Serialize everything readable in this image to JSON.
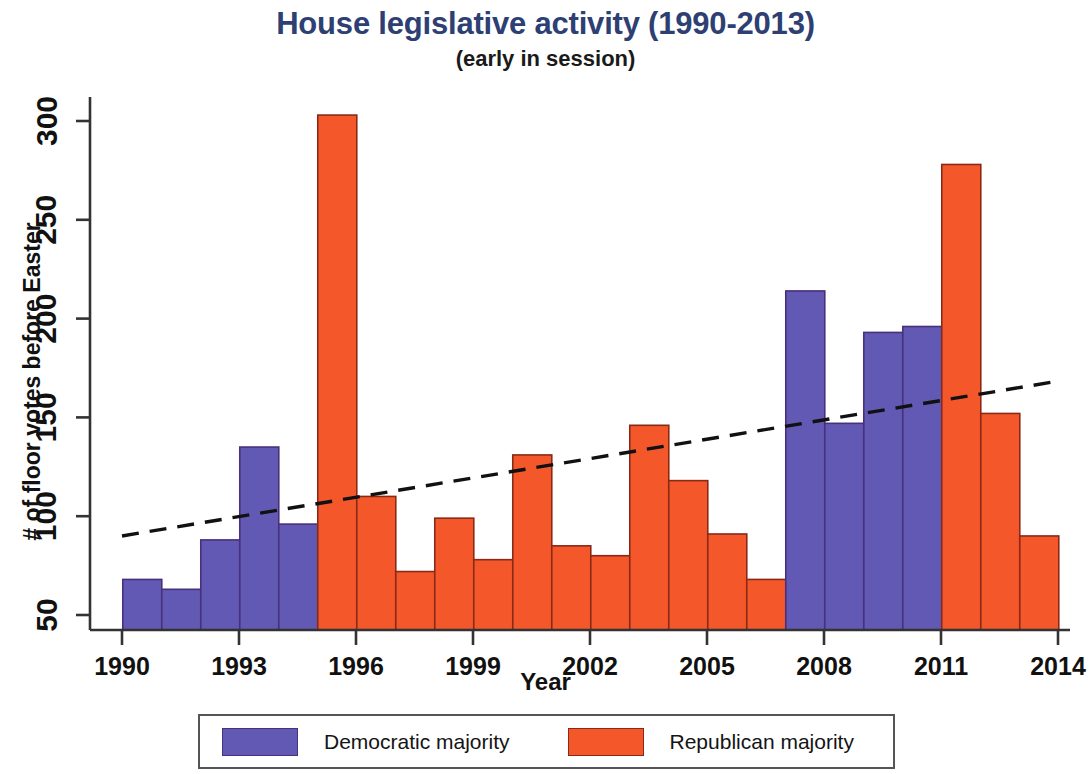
{
  "chart_data": {
    "type": "bar",
    "title": "House legislative activity (1990-2013)",
    "subtitle": "(early in session)",
    "xlabel": "Year",
    "ylabel": "# of floor votes before Easter",
    "xlim": [
      1989.4,
      2014.1
    ],
    "ylim": [
      50,
      310
    ],
    "grid": false,
    "xticks": [
      1990,
      1993,
      1996,
      1999,
      2002,
      2005,
      2008,
      2011,
      2014
    ],
    "xtick_labels": [
      "1990",
      "1993",
      "1996",
      "1999",
      "2002",
      "2005",
      "2008",
      "2011",
      "2014"
    ],
    "yticks": [
      50,
      100,
      150,
      200,
      250,
      300
    ],
    "ytick_labels": [
      "50",
      "100",
      "150",
      "200",
      "250",
      "300"
    ],
    "legend_position": "bottom",
    "categories": [
      1990,
      1991,
      1992,
      1993,
      1994,
      1995,
      1996,
      1997,
      1998,
      1999,
      2000,
      2001,
      2002,
      2003,
      2004,
      2005,
      2006,
      2007,
      2008,
      2009,
      2010,
      2011,
      2012,
      2013
    ],
    "values": [
      68,
      63,
      88,
      135,
      96,
      303,
      110,
      72,
      99,
      78,
      131,
      85,
      80,
      146,
      118,
      91,
      68,
      214,
      147,
      193,
      196,
      278,
      152,
      90
    ],
    "party": [
      "D",
      "D",
      "D",
      "D",
      "D",
      "R",
      "R",
      "R",
      "R",
      "R",
      "R",
      "R",
      "R",
      "R",
      "R",
      "R",
      "R",
      "D",
      "D",
      "D",
      "D",
      "R",
      "R",
      "R"
    ],
    "series": [
      {
        "name": "Democratic majority",
        "color": "#6259b4",
        "points": [
          {
            "year": 1990,
            "value": 68
          },
          {
            "year": 1991,
            "value": 63
          },
          {
            "year": 1992,
            "value": 88
          },
          {
            "year": 1993,
            "value": 135
          },
          {
            "year": 1994,
            "value": 96
          },
          {
            "year": 2007,
            "value": 214
          },
          {
            "year": 2008,
            "value": 147
          },
          {
            "year": 2009,
            "value": 193
          },
          {
            "year": 2010,
            "value": 196
          }
        ]
      },
      {
        "name": "Republican majority",
        "color": "#f4582a",
        "points": [
          {
            "year": 1995,
            "value": 303
          },
          {
            "year": 1996,
            "value": 110
          },
          {
            "year": 1997,
            "value": 72
          },
          {
            "year": 1998,
            "value": 99
          },
          {
            "year": 1999,
            "value": 78
          },
          {
            "year": 2000,
            "value": 131
          },
          {
            "year": 2001,
            "value": 85
          },
          {
            "year": 2002,
            "value": 80
          },
          {
            "year": 2003,
            "value": 146
          },
          {
            "year": 2004,
            "value": 118
          },
          {
            "year": 2005,
            "value": 91
          },
          {
            "year": 2006,
            "value": 68
          },
          {
            "year": 2011,
            "value": 278
          },
          {
            "year": 2012,
            "value": 152
          },
          {
            "year": 2013,
            "value": 90
          }
        ]
      }
    ],
    "trendline": {
      "style": "dashed",
      "color": "#111111",
      "x_start": 1990,
      "y_start": 90,
      "x_end": 2013.9,
      "y_end": 168
    }
  },
  "legend": {
    "entries": [
      {
        "label": "Democratic majority",
        "color": "#6259b4"
      },
      {
        "label": "Republican majority",
        "color": "#f4582a"
      }
    ]
  },
  "colors": {
    "democratic": "#6259b4",
    "republican": "#f4582a",
    "title": "#2e3f73",
    "axis": "#333333",
    "bar_outline_dem": "#4a2f7a",
    "bar_outline_rep": "#8a2a16",
    "trendline": "#111111"
  }
}
